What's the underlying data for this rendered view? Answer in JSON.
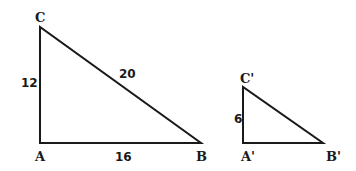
{
  "diagram": {
    "type": "similar-right-triangles",
    "triangle_large": {
      "vertices": {
        "A": "A",
        "B": "B",
        "C": "C"
      },
      "sides": {
        "AC": "12",
        "AB": "16",
        "BC": "20"
      }
    },
    "triangle_small": {
      "vertices": {
        "A": "A'",
        "B": "B'",
        "C": "C'"
      },
      "sides": {
        "AC": "6"
      }
    },
    "stroke_color": "#1a1a1a"
  }
}
